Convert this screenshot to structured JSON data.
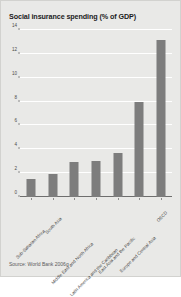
{
  "chart_data": {
    "type": "bar",
    "title": "Social insurance spending (% of GDP)",
    "xlabel": "",
    "ylabel": "",
    "ylim": [
      0,
      14
    ],
    "yticks": [
      0,
      2,
      4,
      6,
      8,
      10,
      12,
      14
    ],
    "grid": true,
    "legend": "none",
    "bar_color": "#7d7d7d",
    "background_color": "#e9e9e7",
    "categories": [
      "Sub-Saharan Africa",
      "South Asia",
      "Middle East and North Africa",
      "Latin America and the Caribbean",
      "East Asia and the Pacific",
      "Europe and Central Asia",
      "OECD"
    ],
    "values": [
      1.5,
      1.9,
      2.9,
      3.0,
      3.7,
      8.0,
      13.2
    ],
    "annotations": {
      "source": "Source: World Bank 2006g"
    }
  }
}
